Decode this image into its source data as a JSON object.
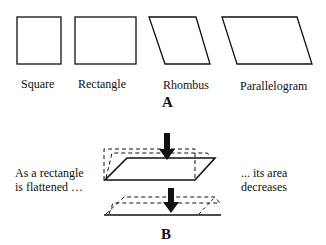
{
  "panel_a": {
    "label": "A",
    "shapes": [
      {
        "name": "Square",
        "label": "Square"
      },
      {
        "name": "Rectangle",
        "label": "Rectangle"
      },
      {
        "name": "Rhombus",
        "label": "Rhombus"
      },
      {
        "name": "Parallelogram",
        "label": "Parallelogram"
      }
    ]
  },
  "panel_b": {
    "label": "B",
    "left_text_line1": "As a rectangle",
    "left_text_line2": "is flattened …",
    "right_text_line1": "... its area",
    "right_text_line2": "decreases"
  },
  "colors": {
    "stroke": "#111111",
    "background": "#ffffff"
  }
}
